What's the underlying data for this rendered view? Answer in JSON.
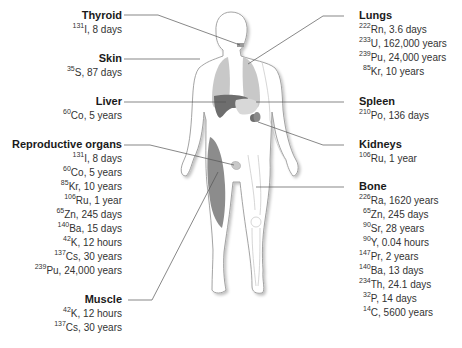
{
  "diagram": {
    "colors": {
      "body_outline": "#9a9a9a",
      "lungs": "#c4c4c4",
      "liver": "#6e6e6e",
      "stomach": "#d6d6d6",
      "muscle": "#8a8a8a",
      "leader_line": "#555555"
    },
    "organs": [
      {
        "name": "Thyroid",
        "side": "left",
        "isotopes": [
          {
            "mass": "131",
            "symbol": "I",
            "half_life": "8 days"
          }
        ]
      },
      {
        "name": "Skin",
        "side": "left",
        "isotopes": [
          {
            "mass": "35",
            "symbol": "S",
            "half_life": "87 days"
          }
        ]
      },
      {
        "name": "Liver",
        "side": "left",
        "isotopes": [
          {
            "mass": "60",
            "symbol": "Co",
            "half_life": "5 years"
          }
        ]
      },
      {
        "name": "Reproductive organs",
        "side": "left",
        "isotopes": [
          {
            "mass": "131",
            "symbol": "I",
            "half_life": "8 days"
          },
          {
            "mass": "60",
            "symbol": "Co",
            "half_life": "5 years"
          },
          {
            "mass": "85",
            "symbol": "Kr",
            "half_life": "10 years"
          },
          {
            "mass": "106",
            "symbol": "Ru",
            "half_life": "1 year"
          },
          {
            "mass": "65",
            "symbol": "Zn",
            "half_life": "245 days"
          },
          {
            "mass": "140",
            "symbol": "Ba",
            "half_life": "15 days"
          },
          {
            "mass": "42",
            "symbol": "K",
            "half_life": "12 hours"
          },
          {
            "mass": "137",
            "symbol": "Cs",
            "half_life": "30 years"
          },
          {
            "mass": "239",
            "symbol": "Pu",
            "half_life": "24,000 years"
          }
        ]
      },
      {
        "name": "Muscle",
        "side": "left",
        "isotopes": [
          {
            "mass": "42",
            "symbol": "K",
            "half_life": "12 hours"
          },
          {
            "mass": "137",
            "symbol": "Cs",
            "half_life": "30 years"
          }
        ]
      },
      {
        "name": "Lungs",
        "side": "right",
        "isotopes": [
          {
            "mass": "222",
            "symbol": "Rn",
            "half_life": "3.6 days"
          },
          {
            "mass": "233",
            "symbol": "U",
            "half_life": "162,000 years"
          },
          {
            "mass": "239",
            "symbol": "Pu",
            "half_life": "24,000 years"
          },
          {
            "mass": "85",
            "symbol": "Kr",
            "half_life": "10 years"
          }
        ]
      },
      {
        "name": "Spleen",
        "side": "right",
        "isotopes": [
          {
            "mass": "210",
            "symbol": "Po",
            "half_life": "136 days"
          }
        ]
      },
      {
        "name": "Kidneys",
        "side": "right",
        "isotopes": [
          {
            "mass": "106",
            "symbol": "Ru",
            "half_life": "1 year"
          }
        ]
      },
      {
        "name": "Bone",
        "side": "right",
        "isotopes": [
          {
            "mass": "226",
            "symbol": "Ra",
            "half_life": "1620 years"
          },
          {
            "mass": "65",
            "symbol": "Zn",
            "half_life": "245 days"
          },
          {
            "mass": "90",
            "symbol": "Sr",
            "half_life": "28 years"
          },
          {
            "mass": "90",
            "symbol": "Y",
            "half_life": "0.04 hours"
          },
          {
            "mass": "147",
            "symbol": "Pr",
            "half_life": "2 years"
          },
          {
            "mass": "140",
            "symbol": "Ba",
            "half_life": "13 days"
          },
          {
            "mass": "234",
            "symbol": "Th",
            "half_life": "24.1 days"
          },
          {
            "mass": "32",
            "symbol": "P",
            "half_life": "14 days"
          },
          {
            "mass": "14",
            "symbol": "C",
            "half_life": "5600 years"
          }
        ]
      }
    ]
  }
}
